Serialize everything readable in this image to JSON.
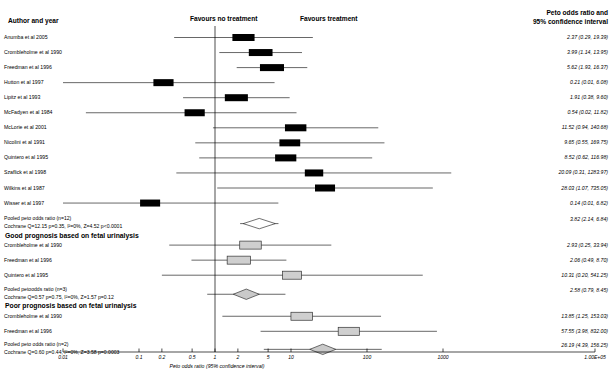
{
  "headers": {
    "author_col": "Author and year",
    "favours_left": "Favours no treatment",
    "favours_right": "Favours treatment",
    "result_col_line1": "Peto odds ratio and",
    "result_col_line2": "95% confidence interval"
  },
  "axis": {
    "title": "Peto odds ratio (95% confidence interval)",
    "ticks": [
      "0.01",
      "0.1",
      "0.2",
      "0.5",
      "1",
      "2",
      "5",
      "10",
      "100",
      "1000",
      "1.00E+05"
    ],
    "tick_values": [
      0.01,
      0.1,
      0.2,
      0.5,
      1,
      2,
      5,
      10,
      100,
      1000,
      100000
    ],
    "null_line": 1,
    "scale": "log",
    "xlim": [
      0.01,
      100000
    ]
  },
  "chart_data": {
    "type": "forest",
    "title": "Peto odds ratio (95% confidence interval)",
    "xlabel": "Peto odds ratio (95% confidence interval)",
    "scale": "log",
    "xlim": [
      0.01,
      100000
    ],
    "null_line": 1,
    "sections": [
      {
        "heading": "",
        "rows": [
          {
            "label": "Anumba et al 2005",
            "or": 2.37,
            "lo": 0.29,
            "hi": 19.39,
            "text": "2.37 (0.29, 19.39)",
            "marker": "box-black"
          },
          {
            "label": "Crombleholme et al 1990",
            "or": 3.99,
            "lo": 1.14,
            "hi": 13.95,
            "text": "3.99 (1.14, 13.95)",
            "marker": "box-black"
          },
          {
            "label": "Freedman et al 1996",
            "or": 5.62,
            "lo": 1.93,
            "hi": 16.37,
            "text": "5.62 (1.93, 16.37)",
            "marker": "box-black"
          },
          {
            "label": "Hutton et al 1997",
            "or": 0.21,
            "lo": 0.01,
            "hi": 6.08,
            "text": "0.21 (0.01, 6.08)",
            "marker": "box-black"
          },
          {
            "label": "Lipitz et al 1993",
            "or": 1.91,
            "lo": 0.38,
            "hi": 9.6,
            "text": "1.91 (0.38, 9.60)",
            "marker": "box-black"
          },
          {
            "label": "McFadyen et al 1984",
            "or": 0.54,
            "lo": 0.02,
            "hi": 11.82,
            "text": "0.54 (0.02, 11.82)",
            "marker": "box-black"
          },
          {
            "label": "McLorie et al 2001",
            "or": 11.52,
            "lo": 0.94,
            "hi": 140.68,
            "text": "11.52 (0.94, 140.68)",
            "marker": "box-black"
          },
          {
            "label": "Nicolini et al 1991",
            "or": 9.65,
            "lo": 0.55,
            "hi": 169.75,
            "text": "9.65 (0.55, 169.75)",
            "marker": "box-black"
          },
          {
            "label": "Quintero et al 1995",
            "or": 8.52,
            "lo": 0.62,
            "hi": 116.98,
            "text": "8.52 (0.62, 116.98)",
            "marker": "box-black"
          },
          {
            "label": "Szaflick et al 1998",
            "or": 20.09,
            "lo": 0.31,
            "hi": 1283.97,
            "text": "20.09 (0.31, 1283.97)",
            "marker": "box-black"
          },
          {
            "label": "Wilkins et al 1987",
            "or": 28.03,
            "lo": 1.07,
            "hi": 735.05,
            "text": "28.03 (1.07, 735.05)",
            "marker": "box-black"
          },
          {
            "label": "Wisser et al 1997",
            "or": 0.14,
            "lo": 0.01,
            "hi": 6.82,
            "text": "0.14 (0.01, 6.82)",
            "marker": "box-black"
          }
        ],
        "pooled": {
          "label": "Pooled peto odds ratio (n=12)",
          "stats": "Cochrane Q=12.15 p=0.35, I²=0%, Z=4.52 p<0.0001",
          "or": 3.82,
          "lo": 2.14,
          "hi": 6.84,
          "text": "3.82 (2.14, 6.84)",
          "marker": "diamond-white"
        }
      },
      {
        "heading": "Good prognosis based on fetal urinalysis",
        "rows": [
          {
            "label": "Crombleholme et al 1990",
            "or": 2.93,
            "lo": 0.25,
            "hi": 33.94,
            "text": "2.93 (0.25, 33.94)",
            "marker": "box-grey"
          },
          {
            "label": "Freedman et al 1996",
            "or": 2.06,
            "lo": 0.49,
            "hi": 8.7,
            "text": "2.06 (0.49, 8.70)",
            "marker": "box-grey"
          },
          {
            "label": "Quintero et al 1995",
            "or": 10.31,
            "lo": 0.2,
            "hi": 541.25,
            "text": "10.31 (0.20, 541.25)",
            "marker": "box-grey"
          }
        ],
        "pooled": {
          "label": "Pooled petoodds ratio (n=3)",
          "stats": "Cochrane Q=0.57 p=0.75, I²=0%, Z=1.57 p=0.12",
          "or": 2.58,
          "lo": 0.79,
          "hi": 8.45,
          "text": "2.58 (0.79, 8.45)",
          "marker": "diamond-grey"
        }
      },
      {
        "heading": "Poor prognosis based on fetal urinalysis",
        "rows": [
          {
            "label": "Crombleholme et al 1990",
            "or": 13.85,
            "lo": 1.25,
            "hi": 153.03,
            "text": "13.85 (1.25, 153.03)",
            "marker": "box-grey"
          },
          {
            "label": "Freedman et al 1996",
            "or": 57.55,
            "lo": 3.98,
            "hi": 832.0,
            "text": "57.55 (3.98, 832.00)",
            "marker": "box-grey"
          }
        ],
        "pooled": {
          "label": "Pooled peto odds ratio (n=2)",
          "stats": "Cochrane Q=0.60 p=0.44, I²=0%, Z=3.58 p=0.0003",
          "or": 26.19,
          "lo": 4.39,
          "hi": 156.25,
          "text": "26.19 (4.39, 156.25)",
          "marker": "diamond-grey"
        }
      }
    ]
  }
}
